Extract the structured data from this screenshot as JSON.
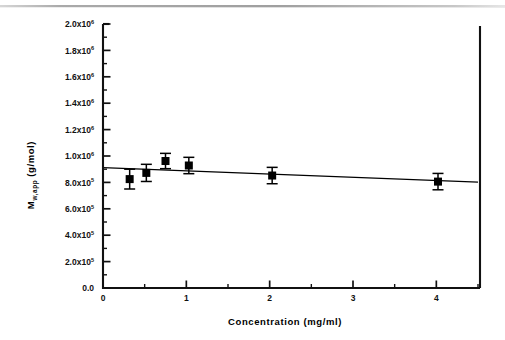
{
  "chart_data": {
    "type": "scatter",
    "title": "",
    "xlabel": "Concentration (mg/ml)",
    "ylabel": "M w,app  (g/mol)",
    "ylabel_base": "M",
    "ylabel_subscript": "w,app",
    "ylabel_units": "(g/mol)",
    "xlim": [
      0,
      4.5
    ],
    "ylim": [
      0,
      2000000
    ],
    "grid": false,
    "legend": null,
    "x_ticks": [
      0,
      1,
      2,
      3,
      4
    ],
    "x_tick_labels": [
      "0",
      "1",
      "2",
      "3",
      "4"
    ],
    "x_minor_ticks": [
      0.5,
      1.5,
      2.5,
      3.5,
      4.5
    ],
    "y_ticks": [
      0,
      200000,
      400000,
      600000,
      800000,
      1000000,
      1200000,
      1400000,
      1600000,
      1800000,
      2000000
    ],
    "y_tick_labels": [
      {
        "mantissa": "0.0",
        "times": "",
        "exponent": ""
      },
      {
        "mantissa": "2.0",
        "times": "x10",
        "exponent": "5"
      },
      {
        "mantissa": "4.0",
        "times": "x10",
        "exponent": "5"
      },
      {
        "mantissa": "6.0",
        "times": "x10",
        "exponent": "5"
      },
      {
        "mantissa": "8.0",
        "times": "x10",
        "exponent": "5"
      },
      {
        "mantissa": "1.0",
        "times": "x10",
        "exponent": "6"
      },
      {
        "mantissa": "1.2",
        "times": "x10",
        "exponent": "6"
      },
      {
        "mantissa": "1.4",
        "times": "x10",
        "exponent": "6"
      },
      {
        "mantissa": "1.6",
        "times": "x10",
        "exponent": "6"
      },
      {
        "mantissa": "1.8",
        "times": "x10",
        "exponent": "6"
      },
      {
        "mantissa": "2.0",
        "times": "x10",
        "exponent": "6"
      }
    ],
    "y_minor_ticks": [
      100000,
      300000,
      500000,
      700000,
      900000,
      1100000,
      1300000,
      1500000,
      1700000,
      1900000
    ],
    "series": [
      {
        "name": "M w,app",
        "marker": "filled-square",
        "color": "#000000",
        "points": [
          {
            "x": 0.32,
            "y": 825000,
            "yerr": 75000
          },
          {
            "x": 0.52,
            "y": 872000,
            "yerr": 65000
          },
          {
            "x": 0.75,
            "y": 962000,
            "yerr": 58000
          },
          {
            "x": 1.03,
            "y": 928000,
            "yerr": 62000
          },
          {
            "x": 2.03,
            "y": 852000,
            "yerr": 62000
          },
          {
            "x": 4.02,
            "y": 806000,
            "yerr": 62000
          }
        ]
      }
    ],
    "fit_line": {
      "name": "linear fit",
      "color": "#000000",
      "x_start": 0.0,
      "y_start": 912000,
      "x_end": 4.5,
      "y_end": 803000
    }
  },
  "artifact": {
    "top_scan_line": "grey-scan-line"
  }
}
